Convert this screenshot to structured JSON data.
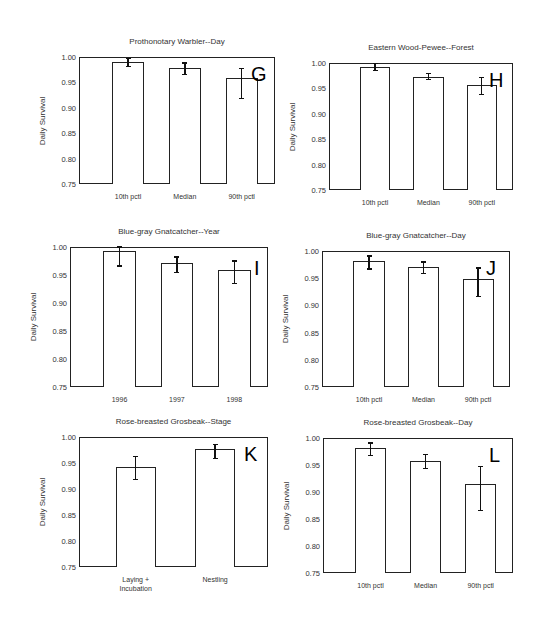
{
  "chart_data": [
    {
      "panel": "G",
      "type": "bar",
      "title": "Prothonotary Warbler--Day",
      "ylabel": "Daily Survival",
      "xlabel": "",
      "categories": [
        "10th pctl",
        "Median",
        "90th pctl"
      ],
      "values": [
        0.99,
        0.979,
        0.958
      ],
      "error_low": [
        0.981,
        0.966,
        0.919
      ],
      "error_high": [
        0.997,
        0.988,
        0.978
      ],
      "ylim": [
        0.75,
        1.0
      ],
      "yticks": [
        "1.00",
        "0.95",
        "0.90",
        "0.85",
        "0.80",
        "0.75"
      ],
      "grid": false,
      "box": {
        "left": 79,
        "top": 57,
        "width": 196,
        "height": 127
      }
    },
    {
      "panel": "H",
      "type": "bar",
      "title": "Eastern Wood-Pewee--Forest",
      "ylabel": "Daily Survival",
      "xlabel": "",
      "categories": [
        "10th pctl",
        "Median",
        "90th pctl"
      ],
      "values": [
        0.992,
        0.973,
        0.957
      ],
      "error_low": [
        0.985,
        0.967,
        0.938
      ],
      "error_high": [
        0.999,
        0.98,
        0.972
      ],
      "ylim": [
        0.75,
        1.0
      ],
      "yticks": [
        "1.00",
        "0.95",
        "0.90",
        "0.85",
        "0.80",
        "0.75"
      ],
      "grid": false,
      "box": {
        "left": 329,
        "top": 63,
        "width": 184,
        "height": 127
      }
    },
    {
      "panel": "I",
      "type": "bar",
      "title": "Blue-gray Gnatcatcher--Year",
      "ylabel": "Daily Survival",
      "xlabel": "",
      "categories": [
        "1996",
        "1997",
        "1998"
      ],
      "values": [
        0.992,
        0.971,
        0.959
      ],
      "error_low": [
        0.966,
        0.954,
        0.935
      ],
      "error_high": [
        1.0,
        0.982,
        0.975
      ],
      "ylim": [
        0.75,
        1.0
      ],
      "yticks": [
        "1.00",
        "0.95",
        "0.90",
        "0.85",
        "0.80",
        "0.75"
      ],
      "grid": false,
      "box": {
        "left": 70,
        "top": 247,
        "width": 198,
        "height": 140
      }
    },
    {
      "panel": "J",
      "type": "bar",
      "title": "Blue-gray Gnatcatcher--Day",
      "ylabel": "Daily Survival",
      "xlabel": "",
      "categories": [
        "10th pctl",
        "Median",
        "90th pctl"
      ],
      "values": [
        0.982,
        0.971,
        0.949
      ],
      "error_low": [
        0.967,
        0.959,
        0.917
      ],
      "error_high": [
        0.991,
        0.98,
        0.969
      ],
      "ylim": [
        0.75,
        1.0
      ],
      "yticks": [
        "1.00",
        "0.95",
        "0.90",
        "0.85",
        "0.80",
        "0.75"
      ],
      "grid": false,
      "box": {
        "left": 322,
        "top": 251,
        "width": 188,
        "height": 136
      }
    },
    {
      "panel": "K",
      "type": "bar",
      "title": "Rose-breasted Grosbeak--Stage",
      "ylabel": "Daily Survival",
      "xlabel": "",
      "categories": [
        "Laying + Incubation",
        "Nestling"
      ],
      "values": [
        0.943,
        0.976
      ],
      "error_low": [
        0.918,
        0.959
      ],
      "error_high": [
        0.962,
        0.986
      ],
      "ylim": [
        0.75,
        1.0
      ],
      "yticks": [
        "1.00",
        "0.95",
        "0.90",
        "0.85",
        "0.80",
        "0.75"
      ],
      "grid": false,
      "box": {
        "left": 79,
        "top": 437,
        "width": 189,
        "height": 130
      }
    },
    {
      "panel": "L",
      "type": "bar",
      "title": "Rose-breasted Grosbeak--Day",
      "ylabel": "Daily Survival",
      "xlabel": "",
      "categories": [
        "10th pctl",
        "Median",
        "90th pctl"
      ],
      "values": [
        0.982,
        0.958,
        0.914
      ],
      "error_low": [
        0.968,
        0.944,
        0.866
      ],
      "error_high": [
        0.991,
        0.97,
        0.947
      ],
      "ylim": [
        0.75,
        1.0
      ],
      "yticks": [
        "1.00",
        "0.95",
        "0.90",
        "0.85",
        "0.80",
        "0.75"
      ],
      "grid": false,
      "box": {
        "left": 323,
        "top": 438,
        "width": 190,
        "height": 135
      }
    }
  ],
  "labels": {
    "G": {
      "title": "Prothonotary Warbler--Day",
      "ylabel": "Daily Survival",
      "letter": "G"
    },
    "H": {
      "title": "Eastern Wood-Pewee--Forest",
      "ylabel": "Daily Survival",
      "letter": "H"
    },
    "I": {
      "title": "Blue-gray Gnatcatcher--Year",
      "ylabel": "Daily Survival",
      "letter": "I"
    },
    "J": {
      "title": "Blue-gray Gnatcatcher--Day",
      "ylabel": "Daily Survival",
      "letter": "J"
    },
    "K": {
      "title": "Rose-breasted Grosbeak--Stage",
      "ylabel": "Daily Survival",
      "letter": "K"
    },
    "L": {
      "title": "Rose-breasted Grosbeak--Day",
      "ylabel": "Daily Survival",
      "letter": "L"
    }
  },
  "colors": {
    "bar_fill": "#ffffff",
    "bar_edge": "#222222",
    "error_bar": "#111111",
    "background": "#ffffff"
  }
}
